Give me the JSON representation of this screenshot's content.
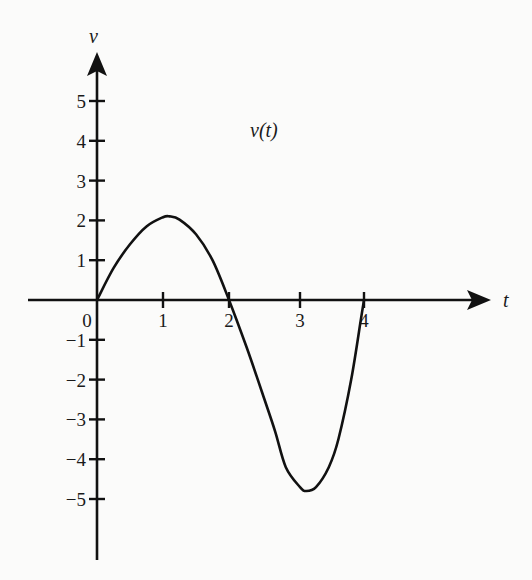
{
  "chart_data": {
    "type": "line",
    "title": "",
    "xlabel": "t",
    "ylabel": "v",
    "xlim": [
      0,
      4
    ],
    "ylim": [
      -5,
      5
    ],
    "grid": false,
    "legend": null,
    "x_ticks": [
      "0",
      "1",
      "2",
      "3",
      "4"
    ],
    "y_ticks": [
      "5",
      "4",
      "3",
      "2",
      "1",
      "−1",
      "−2",
      "−3",
      "−4",
      "−5"
    ],
    "annotations": [
      {
        "text": "v(t)",
        "x": 2.3,
        "y": 4.3
      }
    ],
    "series": [
      {
        "name": "v(t)",
        "x": [
          0,
          0.25,
          0.5,
          0.75,
          1.0,
          1.1,
          1.25,
          1.5,
          1.75,
          2.0,
          2.25,
          2.5,
          2.65,
          2.8,
          3.0,
          3.1,
          3.25,
          3.45,
          3.6,
          3.8,
          3.95,
          4.0
        ],
        "y": [
          0,
          0.8,
          1.4,
          1.85,
          2.08,
          2.1,
          2.02,
          1.65,
          1.0,
          0.0,
          -1.2,
          -2.5,
          -3.3,
          -4.2,
          -4.7,
          -4.8,
          -4.7,
          -4.2,
          -3.5,
          -2.0,
          -0.5,
          0
        ]
      }
    ]
  },
  "labels": {
    "y_axis": "v",
    "x_axis": "t",
    "curve": "v(t)",
    "origin": "0"
  }
}
